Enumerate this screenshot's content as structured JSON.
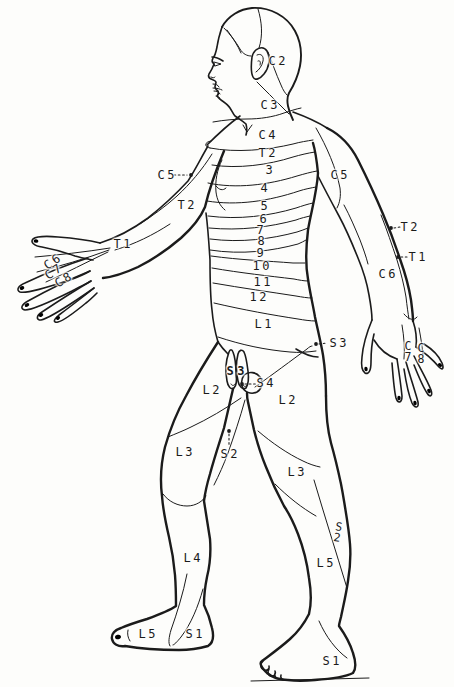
{
  "canvas": {
    "width": 454,
    "height": 687,
    "background": "#fdfdfb",
    "ink": "#1b1b1b"
  },
  "labels": [
    {
      "id": "c2",
      "text": "C2",
      "x": 277,
      "y": 61
    },
    {
      "id": "c3",
      "text": "C3",
      "x": 269,
      "y": 105
    },
    {
      "id": "c4",
      "text": "C4",
      "x": 267,
      "y": 135
    },
    {
      "id": "t2-chest",
      "text": "T2",
      "x": 267,
      "y": 153
    },
    {
      "id": "band-3",
      "text": "3",
      "x": 269,
      "y": 170
    },
    {
      "id": "band-4",
      "text": "4",
      "x": 264,
      "y": 188
    },
    {
      "id": "band-5",
      "text": "5",
      "x": 264,
      "y": 206
    },
    {
      "id": "band-6",
      "text": "6",
      "x": 263,
      "y": 219
    },
    {
      "id": "band-7",
      "text": "7",
      "x": 260,
      "y": 230
    },
    {
      "id": "band-8",
      "text": "8",
      "x": 261,
      "y": 241
    },
    {
      "id": "band-9",
      "text": "9",
      "x": 260,
      "y": 253
    },
    {
      "id": "band-10",
      "text": "10",
      "x": 261,
      "y": 266
    },
    {
      "id": "band-11",
      "text": "11",
      "x": 262,
      "y": 282
    },
    {
      "id": "band-12",
      "text": "12",
      "x": 258,
      "y": 297
    },
    {
      "id": "l1",
      "text": "L1",
      "x": 263,
      "y": 324
    },
    {
      "id": "c5-left",
      "text": "C5",
      "x": 166,
      "y": 175
    },
    {
      "id": "t2-left-arm",
      "text": "T2",
      "x": 186,
      "y": 205
    },
    {
      "id": "t1-left-arm",
      "text": "T1",
      "x": 122,
      "y": 244
    },
    {
      "id": "c6-left-hand",
      "text": "C6",
      "x": 52,
      "y": 262,
      "rot": -34
    },
    {
      "id": "c7-left-hand",
      "text": "C7",
      "x": 53,
      "y": 272,
      "rot": -34
    },
    {
      "id": "c8-left-hand",
      "text": "C8",
      "x": 63,
      "y": 280,
      "rot": -30
    },
    {
      "id": "c5-right",
      "text": "C5",
      "x": 339,
      "y": 175
    },
    {
      "id": "t2-right",
      "text": "T2",
      "x": 409,
      "y": 227
    },
    {
      "id": "t1-right",
      "text": "T1",
      "x": 417,
      "y": 257
    },
    {
      "id": "c6-right-arm",
      "text": "C6",
      "x": 387,
      "y": 274
    },
    {
      "id": "c7-right-hand",
      "lines": [
        "C",
        "7"
      ],
      "x": 408,
      "y": 351
    },
    {
      "id": "c8-right-hand",
      "lines": [
        "C",
        "8"
      ],
      "x": 421,
      "y": 353
    },
    {
      "id": "s3-buttock",
      "text": "S3",
      "x": 338,
      "y": 343
    },
    {
      "id": "s3-genital",
      "text": "S3",
      "x": 236,
      "y": 371,
      "bold": true
    },
    {
      "id": "s4",
      "text": "S4",
      "x": 265,
      "y": 383
    },
    {
      "id": "l2-front-thigh",
      "text": "L2",
      "x": 211,
      "y": 390
    },
    {
      "id": "l2-back-thigh",
      "text": "L2",
      "x": 287,
      "y": 400
    },
    {
      "id": "s2-crotch",
      "text": "S2",
      "x": 229,
      "y": 454
    },
    {
      "id": "l3-front-thigh",
      "text": "L3",
      "x": 184,
      "y": 452
    },
    {
      "id": "l3-back-leg",
      "text": "L3",
      "x": 296,
      "y": 472
    },
    {
      "id": "l4-shin",
      "text": "L4",
      "x": 192,
      "y": 558
    },
    {
      "id": "s2-back-leg",
      "lines": [
        "S",
        "2"
      ],
      "x": 338,
      "y": 532,
      "rot": 10
    },
    {
      "id": "l5-back-leg",
      "text": "L5",
      "x": 325,
      "y": 563
    },
    {
      "id": "l5-front-foot",
      "text": "L5",
      "x": 147,
      "y": 634
    },
    {
      "id": "s1-front-foot",
      "text": "S1",
      "x": 194,
      "y": 634
    },
    {
      "id": "s1-back-foot",
      "text": "S1",
      "x": 331,
      "y": 661
    }
  ],
  "leaders": [
    {
      "id": "c5-left",
      "dot": [
        191,
        175
      ],
      "from": [
        174,
        175
      ],
      "to": [
        187,
        175
      ]
    },
    {
      "id": "t2-right",
      "dot": [
        391,
        228
      ],
      "from": [
        394,
        228
      ],
      "to": [
        400,
        227
      ]
    },
    {
      "id": "t1-right",
      "dot": [
        398,
        257
      ],
      "from": [
        401,
        257
      ],
      "to": [
        407,
        257
      ]
    },
    {
      "id": "s3-buttock",
      "dot": [
        316,
        344
      ],
      "from": [
        319,
        344
      ],
      "to": [
        327,
        343
      ]
    },
    {
      "id": "s4",
      "dot": [
        242,
        384
      ],
      "from": [
        245,
        384
      ],
      "to": [
        256,
        384
      ]
    },
    {
      "id": "s2-crotch",
      "dot": [
        229,
        431
      ],
      "from": [
        229,
        434
      ],
      "to": [
        229,
        446
      ]
    }
  ]
}
